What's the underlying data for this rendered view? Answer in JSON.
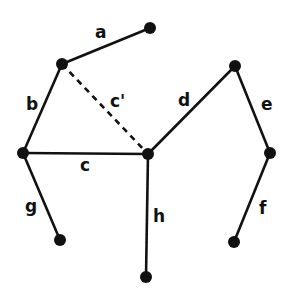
{
  "diagram": {
    "type": "graph",
    "colors": {
      "edge": "#111111",
      "node": "#111111",
      "background": "#ffffff"
    },
    "nodes": [
      {
        "id": "n1",
        "x": 150,
        "y": 28
      },
      {
        "id": "n2",
        "x": 62,
        "y": 64
      },
      {
        "id": "n3",
        "x": 23,
        "y": 153
      },
      {
        "id": "n4",
        "x": 148,
        "y": 154
      },
      {
        "id": "n5",
        "x": 235,
        "y": 66
      },
      {
        "id": "n6",
        "x": 270,
        "y": 153
      },
      {
        "id": "n7",
        "x": 60,
        "y": 240
      },
      {
        "id": "n8",
        "x": 146,
        "y": 277
      },
      {
        "id": "n9",
        "x": 234,
        "y": 242
      }
    ],
    "edges": [
      {
        "label": "a",
        "from": "n2",
        "to": "n1",
        "style": "solid",
        "lx": 95,
        "ly": 24
      },
      {
        "label": "b",
        "from": "n3",
        "to": "n2",
        "style": "solid",
        "lx": 26,
        "ly": 96
      },
      {
        "label": "c'",
        "from": "n2",
        "to": "n4",
        "style": "dashed",
        "lx": 110,
        "ly": 93
      },
      {
        "label": "c",
        "from": "n3",
        "to": "n4",
        "style": "solid",
        "lx": 80,
        "ly": 157
      },
      {
        "label": "d",
        "from": "n4",
        "to": "n5",
        "style": "solid",
        "lx": 178,
        "ly": 92
      },
      {
        "label": "e",
        "from": "n5",
        "to": "n6",
        "style": "solid",
        "lx": 261,
        "ly": 96
      },
      {
        "label": "f",
        "from": "n6",
        "to": "n9",
        "style": "solid",
        "lx": 259,
        "ly": 200
      },
      {
        "label": "g",
        "from": "n3",
        "to": "n7",
        "style": "solid",
        "lx": 25,
        "ly": 198
      },
      {
        "label": "h",
        "from": "n4",
        "to": "n8",
        "style": "solid",
        "lx": 153,
        "ly": 208
      }
    ]
  }
}
